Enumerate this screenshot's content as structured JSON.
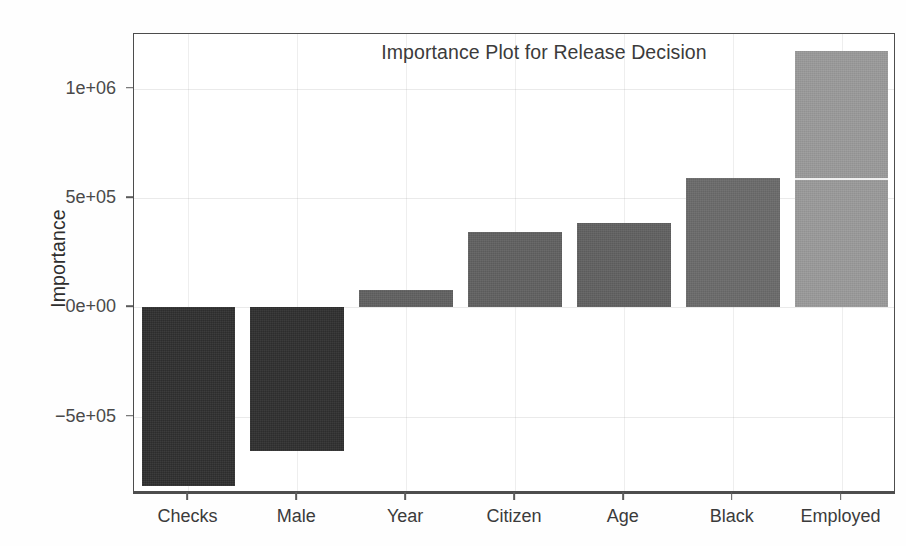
{
  "chart_data": {
    "type": "bar",
    "title": "Importance Plot for Release Decision",
    "xlabel": "",
    "ylabel": "Importance",
    "categories": [
      "Checks",
      "Male",
      "Year",
      "Citizen",
      "Age",
      "Black",
      "Employed"
    ],
    "values": [
      -820000,
      -660000,
      80000,
      345000,
      385000,
      590000,
      1170000
    ],
    "bar_colors": [
      "#2f2f2f",
      "#2f2f2f",
      "#606060",
      "#606060",
      "#606060",
      "#6a6a6a",
      "#9a9a9a"
    ],
    "ylim": [
      -850000,
      1250000
    ],
    "ytick_values": [
      1000000,
      500000,
      0,
      -500000
    ],
    "ytick_labels": [
      "1e+06",
      "5e+05",
      "0e+00",
      "−5e+05"
    ],
    "grid": true,
    "legend": null,
    "series": [
      {
        "name": "Importance",
        "points": [
          {
            "category": "Checks",
            "value": -820000
          },
          {
            "category": "Male",
            "value": -660000
          },
          {
            "category": "Year",
            "value": 80000
          },
          {
            "category": "Citizen",
            "value": 345000
          },
          {
            "category": "Age",
            "value": 385000
          },
          {
            "category": "Black",
            "value": 590000
          },
          {
            "category": "Employed",
            "value": 1170000
          }
        ]
      }
    ]
  },
  "figure": {
    "background_color": "#ffffff",
    "axis_color": "#4d4d4d",
    "text_color": "#3b3b3b"
  }
}
